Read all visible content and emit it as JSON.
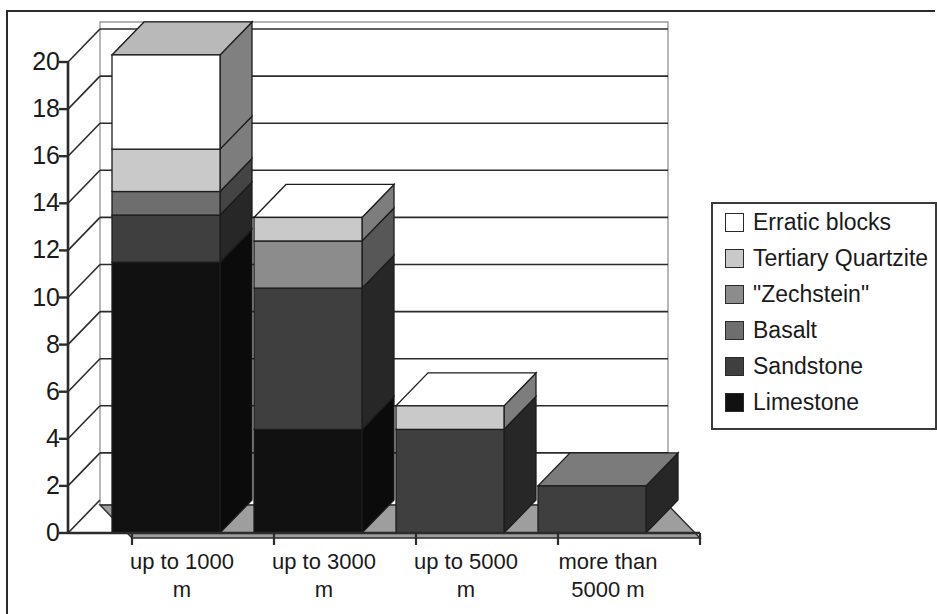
{
  "chart_data": {
    "type": "bar",
    "subtype": "stacked-column-3d",
    "title": "",
    "xlabel": "",
    "ylabel": "",
    "ylim": [
      0,
      20
    ],
    "y_ticks": [
      0,
      2,
      4,
      6,
      8,
      10,
      12,
      14,
      16,
      18,
      20
    ],
    "y_tick_labels": [
      "0",
      "2",
      "4",
      "6",
      "8",
      "10",
      "12",
      "14",
      "16",
      "18",
      "20"
    ],
    "grid": true,
    "legend_position": "right",
    "categories": [
      "up to 1000 m",
      "up to 3000 m",
      "up to 5000 m",
      "more than 5000 m"
    ],
    "category_lines": [
      [
        "up to 1000",
        "m"
      ],
      [
        "up to 3000",
        "m"
      ],
      [
        "up to 5000",
        "m"
      ],
      [
        "more than",
        "5000 m"
      ]
    ],
    "series": [
      {
        "name": "Limestone",
        "color": "#111111",
        "values": [
          11.5,
          4.4,
          0.0,
          0.0
        ]
      },
      {
        "name": "Sandstone",
        "color": "#3f3f3f",
        "values": [
          2.0,
          6.0,
          4.4,
          2.0
        ]
      },
      {
        "name": "Basalt",
        "color": "#6e6e6e",
        "values": [
          1.0,
          0.0,
          0.0,
          0.0
        ]
      },
      {
        "name": "\"Zechstein\"",
        "color": "#8c8c8c",
        "values": [
          0.0,
          2.0,
          0.0,
          0.0
        ]
      },
      {
        "name": "Tertiary Quartzite",
        "color": "#c9c9c9",
        "values": [
          1.8,
          1.0,
          1.0,
          0.0
        ]
      },
      {
        "name": "Erratic blocks",
        "color": "#ffffff",
        "values": [
          4.0,
          0.0,
          0.0,
          0.0
        ]
      }
    ],
    "totals": [
      20.3,
      13.4,
      5.4,
      2.0
    ]
  },
  "legend": {
    "items": [
      {
        "label": "Erratic blocks",
        "color": "#ffffff"
      },
      {
        "label": "Tertiary Quartzite",
        "color": "#c9c9c9"
      },
      {
        "label": "\"Zechstein\"",
        "color": "#8c8c8c"
      },
      {
        "label": "Basalt",
        "color": "#6e6e6e"
      },
      {
        "label": "Sandstone",
        "color": "#3f3f3f"
      },
      {
        "label": "Limestone",
        "color": "#111111"
      }
    ]
  },
  "axes": {
    "y_tick_labels": [
      "20",
      "18",
      "16",
      "14",
      "12",
      "10",
      "8",
      "6",
      "4",
      "2",
      "0"
    ],
    "x_tick_labels": [
      {
        "line1": "up to 1000",
        "line2": "m"
      },
      {
        "line1": "up to 3000",
        "line2": "m"
      },
      {
        "line1": "up to 5000",
        "line2": "m"
      },
      {
        "line1": "more than",
        "line2": "5000 m"
      }
    ]
  },
  "colors": {
    "floor": "#9e9e9e",
    "side_shade": "#5a5a5a",
    "axis_line": "#2b2b2b",
    "grid_line": "#2b2b2b",
    "plot_background": "#ffffff"
  }
}
